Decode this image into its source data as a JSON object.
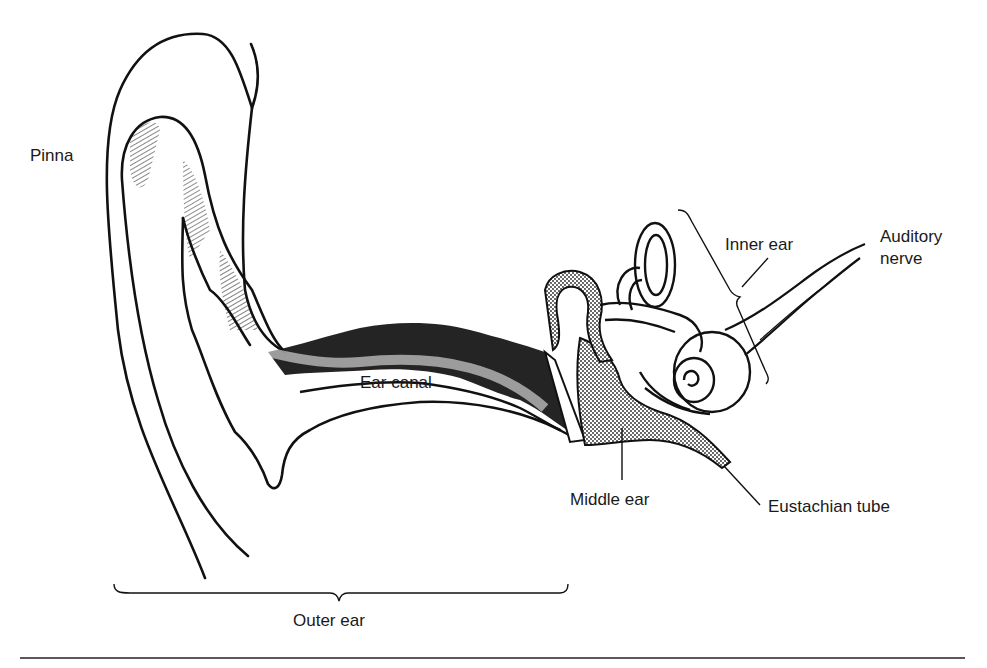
{
  "diagram": {
    "type": "anatomical-line-drawing",
    "colors": {
      "background": "#ffffff",
      "ink": "#111111",
      "label_text": "#1a1a1a"
    },
    "labels": {
      "pinna": "Pinna",
      "ear_canal": "Ear canal",
      "inner_ear": "Inner ear",
      "auditory_nerve_line1": "Auditory",
      "auditory_nerve_line2": "nerve",
      "middle_ear": "Middle ear",
      "eustachian_tube": "Eustachian tube",
      "outer_ear": "Outer ear"
    },
    "regions": [
      {
        "id": "outer-ear",
        "label": "Outer ear",
        "indicator": "horizontal-brace-below"
      },
      {
        "id": "middle-ear",
        "label": "Middle ear",
        "indicator": "leader-line"
      },
      {
        "id": "inner-ear",
        "label": "Inner ear",
        "indicator": "vertical-brace-with-leader"
      }
    ],
    "parts": [
      {
        "id": "pinna",
        "label": "Pinna"
      },
      {
        "id": "ear-canal",
        "label": "Ear canal"
      },
      {
        "id": "auditory-nerve",
        "label": "Auditory nerve"
      },
      {
        "id": "eustachian-tube",
        "label": "Eustachian tube"
      }
    ]
  }
}
